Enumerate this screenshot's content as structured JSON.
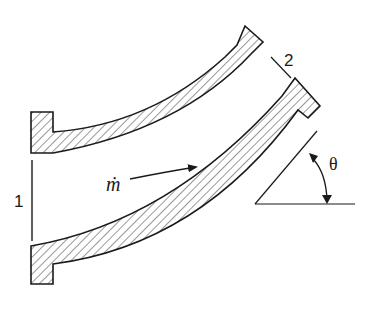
{
  "diagram": {
    "type": "curved pipe bend (reducing elbow) cross-section",
    "labels": {
      "inlet": "1",
      "outlet": "2",
      "mass_flow": "ṁ",
      "angle": "θ"
    },
    "colors": {
      "stroke": "#1a1a1a",
      "hatch": "#333333",
      "background": "#ffffff"
    },
    "elements": [
      {
        "name": "upper-pipe-wall",
        "style": "hatched"
      },
      {
        "name": "lower-pipe-wall",
        "style": "hatched"
      },
      {
        "name": "inlet-flange-top",
        "style": "hatched"
      },
      {
        "name": "inlet-flange-bottom",
        "style": "hatched"
      },
      {
        "name": "outlet-flange-top",
        "style": "hatched"
      },
      {
        "name": "outlet-flange-bottom",
        "style": "hatched"
      },
      {
        "name": "inlet-section-line"
      },
      {
        "name": "outlet-section-line"
      },
      {
        "name": "flow-arrow"
      },
      {
        "name": "angle-indicator"
      }
    ]
  }
}
